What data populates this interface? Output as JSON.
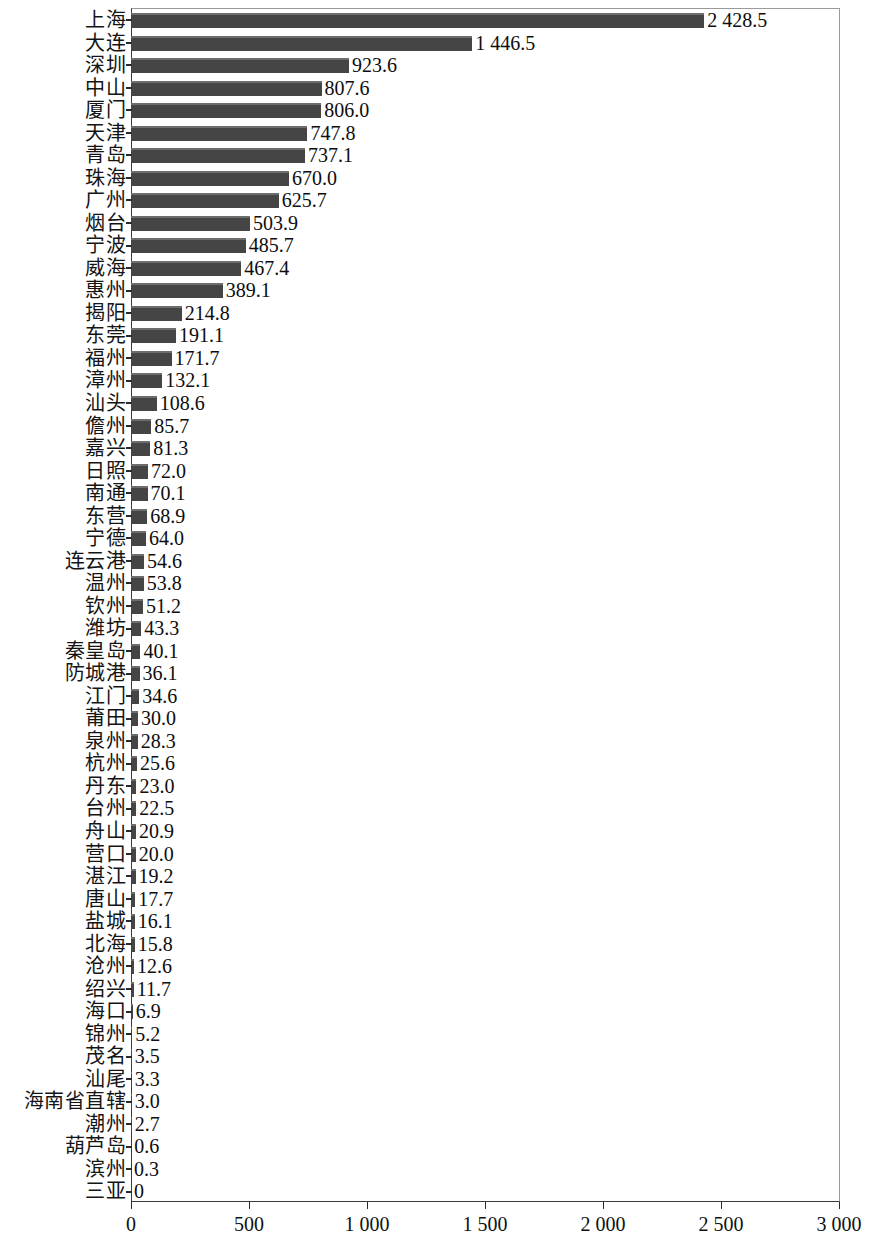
{
  "chart_data": {
    "type": "bar",
    "orientation": "horizontal",
    "title": "",
    "subtitle": "",
    "xlabel": "",
    "ylabel": "",
    "xlim": [
      0,
      3000
    ],
    "grid": false,
    "legend": null,
    "bar_color": "#454545",
    "x_tick_labels": [
      "0",
      "500",
      "1 000",
      "1 500",
      "2 000",
      "2 500",
      "3 000"
    ],
    "x_tick_values": [
      0,
      500,
      1000,
      1500,
      2000,
      2500,
      3000
    ],
    "categories": [
      "上海",
      "大连",
      "深圳",
      "中山",
      "厦门",
      "天津",
      "青岛",
      "珠海",
      "广州",
      "烟台",
      "宁波",
      "威海",
      "惠州",
      "揭阳",
      "东莞",
      "福州",
      "漳州",
      "汕头",
      "儋州",
      "嘉兴",
      "日照",
      "南通",
      "东营",
      "宁德",
      "连云港",
      "温州",
      "钦州",
      "潍坊",
      "秦皇岛",
      "防城港",
      "江门",
      "莆田",
      "泉州",
      "杭州",
      "丹东",
      "台州",
      "舟山",
      "营口",
      "湛江",
      "唐山",
      "盐城",
      "北海",
      "沧州",
      "绍兴",
      "海口",
      "锦州",
      "茂名",
      "汕尾",
      "海南省直辖",
      "潮州",
      "葫芦岛",
      "滨州",
      "三亚"
    ],
    "values": [
      2428.5,
      1446.5,
      923.6,
      807.6,
      806.0,
      747.8,
      737.1,
      670.0,
      625.7,
      503.9,
      485.7,
      467.4,
      389.1,
      214.8,
      191.1,
      171.7,
      132.1,
      108.6,
      85.7,
      81.3,
      72.0,
      70.1,
      68.9,
      64.0,
      54.6,
      53.8,
      51.2,
      43.3,
      40.1,
      36.1,
      34.6,
      30.0,
      28.3,
      25.6,
      23.0,
      22.5,
      20.9,
      20.0,
      19.2,
      17.7,
      16.1,
      15.8,
      12.6,
      11.7,
      6.9,
      5.2,
      3.5,
      3.3,
      3.0,
      2.7,
      0.6,
      0.3,
      0
    ],
    "value_labels": [
      "2 428.5",
      "1 446.5",
      "923.6",
      "807.6",
      "806.0",
      "747.8",
      "737.1",
      "670.0",
      "625.7",
      "503.9",
      "485.7",
      "467.4",
      "389.1",
      "214.8",
      "191.1",
      "171.7",
      "132.1",
      "108.6",
      "85.7",
      "81.3",
      "72.0",
      "70.1",
      "68.9",
      "64.0",
      "54.6",
      "53.8",
      "51.2",
      "43.3",
      "40.1",
      "36.1",
      "34.6",
      "30.0",
      "28.3",
      "25.6",
      "23.0",
      "22.5",
      "20.9",
      "20.0",
      "19.2",
      "17.7",
      "16.1",
      "15.8",
      "12.6",
      "11.7",
      "6.9",
      "5.2",
      "3.5",
      "3.3",
      "3.0",
      "2.7",
      "0.6",
      "0.3",
      "0"
    ]
  }
}
